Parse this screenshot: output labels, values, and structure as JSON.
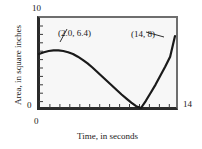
{
  "chart_data": {
    "type": "line",
    "title": "",
    "subtitle": "",
    "xlabel": "Time, in seconds",
    "ylabel": "Area, in square inches",
    "xlim": [
      0,
      14
    ],
    "ylim": [
      0,
      10
    ],
    "xticks": [
      0,
      14
    ],
    "xtick_labels": [
      "0",
      "14"
    ],
    "yticks": [
      0,
      10
    ],
    "ytick_labels": [
      "0",
      "10"
    ],
    "minor_ticks": true,
    "grid": false,
    "legend": null,
    "series": [
      {
        "name": "Area over time",
        "x": [
          0.0,
          0.5,
          1.0,
          1.5,
          2.0,
          2.5,
          3.0,
          3.5,
          4.0,
          4.5,
          5.0,
          5.5,
          6.0,
          6.5,
          7.0,
          7.5,
          8.0,
          8.5,
          9.0,
          9.5,
          10.0,
          10.5,
          11.0,
          11.5,
          12.0,
          12.5,
          13.0,
          13.5,
          14.0
        ],
        "y": [
          6.0,
          6.2,
          6.33,
          6.4,
          6.4,
          6.33,
          6.2,
          6.0,
          5.7,
          5.35,
          4.95,
          4.5,
          4.0,
          3.5,
          3.0,
          2.5,
          2.0,
          1.5,
          1.05,
          0.6,
          0.2,
          0.0,
          0.8,
          1.7,
          2.6,
          3.6,
          4.6,
          5.7,
          8.0
        ],
        "color": "#1a1a1a"
      }
    ],
    "annotations": [
      {
        "label": "(2.0, 6.4)",
        "x": 2.0,
        "y": 6.4,
        "role": "local-maximum"
      },
      {
        "label": "(14, 8)",
        "x": 14,
        "y": 8,
        "role": "endpoint"
      }
    ],
    "colors": {
      "curve": "#1a1a1a",
      "frame": "#2b2b2b",
      "plot_background": "#f7f7f7",
      "figure_background": "#ffffff",
      "text": "#1a1a1a"
    }
  }
}
